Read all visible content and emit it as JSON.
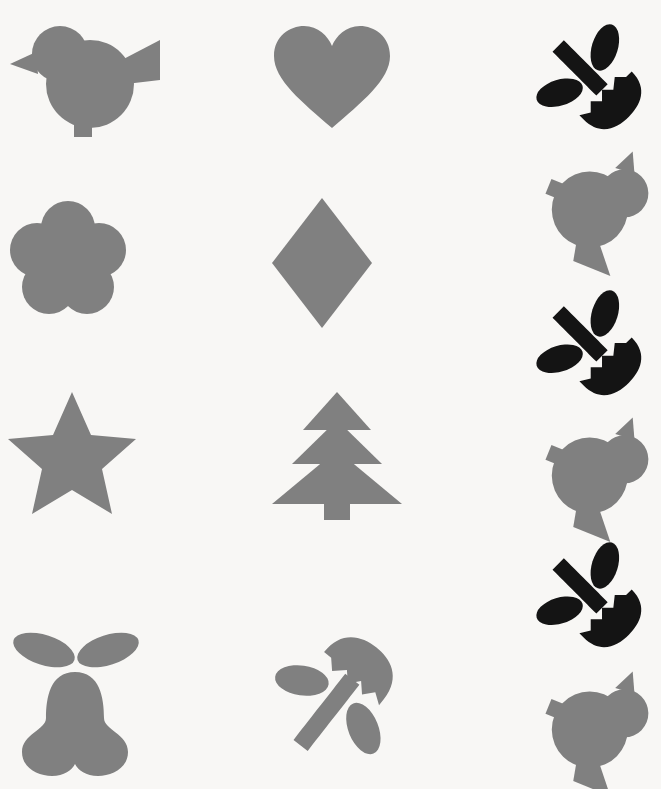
{
  "canvas": {
    "width": 661,
    "height": 789,
    "background_color": "#f8f7f5",
    "description": "Flat silhouette shape icon sheet"
  },
  "palette": {
    "gray": "#808080",
    "black": "#141414",
    "background": "#f8f7f5"
  },
  "grid": {
    "columns": 3,
    "rows": 4,
    "right_column_items": 6
  },
  "icons": [
    {
      "id": "bird-right",
      "name": "bird",
      "label": "Bird",
      "color": "#808080",
      "column": 1,
      "row": 1,
      "facing": "right",
      "rotation_deg": 0
    },
    {
      "id": "heart",
      "name": "heart",
      "label": "Heart",
      "color": "#808080",
      "column": 2,
      "row": 1,
      "facing": "up",
      "rotation_deg": 0
    },
    {
      "id": "tulip-black-1",
      "name": "tulip",
      "label": "Tulip with leaves",
      "color": "#141414",
      "column": 3,
      "row": 1,
      "facing": "down-right",
      "rotation_deg": 135
    },
    {
      "id": "flower-five-petal",
      "name": "flower",
      "label": "Five petal flower",
      "color": "#808080",
      "column": 1,
      "row": 2,
      "facing": "up",
      "rotation_deg": 0
    },
    {
      "id": "diamond",
      "name": "diamond",
      "label": "Diamond",
      "color": "#808080",
      "column": 2,
      "row": 2,
      "facing": "up",
      "rotation_deg": 0
    },
    {
      "id": "bird-gray-2",
      "name": "bird",
      "label": "Bird",
      "color": "#808080",
      "column": 3,
      "row": 2,
      "facing": "left",
      "rotation_deg": 115
    },
    {
      "id": "star",
      "name": "star",
      "label": "Five pointed star",
      "color": "#808080",
      "column": 1,
      "row": 3,
      "facing": "up",
      "rotation_deg": 0
    },
    {
      "id": "tree",
      "name": "tree",
      "label": "Fir tree",
      "color": "#808080",
      "column": 2,
      "row": 3,
      "facing": "up",
      "rotation_deg": 0
    },
    {
      "id": "tulip-black-2",
      "name": "tulip",
      "label": "Tulip with leaves",
      "color": "#141414",
      "column": 3,
      "row": 3,
      "facing": "down-right",
      "rotation_deg": 135
    },
    {
      "id": "bird-gray-4",
      "name": "bird",
      "label": "Bird",
      "color": "#808080",
      "column": 3,
      "row": 4,
      "facing": "left",
      "rotation_deg": 115
    },
    {
      "id": "pear",
      "name": "pear",
      "label": "Pear with two leaves",
      "color": "#808080",
      "column": 1,
      "row": 4,
      "facing": "up",
      "rotation_deg": 0
    },
    {
      "id": "tulip-gray",
      "name": "tulip",
      "label": "Tulip with leaves",
      "color": "#808080",
      "column": 2,
      "row": 4,
      "facing": "up-right",
      "rotation_deg": 40
    },
    {
      "id": "tulip-black-3",
      "name": "tulip",
      "label": "Tulip with leaves",
      "color": "#141414",
      "column": 3,
      "row": 5,
      "facing": "down-right",
      "rotation_deg": 135
    },
    {
      "id": "bird-gray-6",
      "name": "bird",
      "label": "Bird",
      "color": "#808080",
      "column": 3,
      "row": 6,
      "facing": "left",
      "rotation_deg": 115
    }
  ]
}
